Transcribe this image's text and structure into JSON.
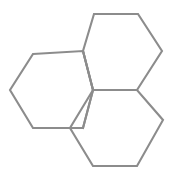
{
  "figure": {
    "kind": "chemical-structure-diagram",
    "title": "",
    "caption": "",
    "background_color": "#ffffff",
    "line_color": "#8c8c8c",
    "line_width": 2.1,
    "width": 183,
    "height": 180,
    "labels": [],
    "atom_labels": [],
    "charges": [],
    "stereo_marks": []
  },
  "chart_data": {
    "type": "diagram",
    "title": "",
    "subtitle": "",
    "xlabel": "",
    "ylabel": "",
    "grid": false,
    "legend": [],
    "annotations": [],
    "structure": {
      "name": "fused tricyclic hexagon skeleton",
      "ring_count": 3,
      "ring_size": 6,
      "fusion_type": "angular/peri-fused",
      "bond_style": "single-line skeletal",
      "vertex_count": 13,
      "bond_count": 15,
      "rings": [
        {
          "id": "ring-top-right",
          "label": "",
          "orientation": "flat-top",
          "vertices": [
            [
              94,
              14
            ],
            [
              138,
              14
            ],
            [
              162,
              51
            ],
            [
              137,
              90
            ],
            [
              93,
              90
            ],
            [
              83,
              51
            ]
          ]
        },
        {
          "id": "ring-left",
          "label": "",
          "orientation": "flat-top",
          "vertices": [
            [
              33,
              54
            ],
            [
              83,
              51
            ],
            [
              93,
              90
            ],
            [
              83,
              128
            ],
            [
              33,
              128
            ],
            [
              10,
              90
            ]
          ]
        },
        {
          "id": "ring-bottom-right",
          "label": "",
          "orientation": "flat-bottom",
          "vertices": [
            [
              93,
              90
            ],
            [
              137,
              90
            ],
            [
              163,
              120
            ],
            [
              137,
              166
            ],
            [
              93,
              166
            ],
            [
              70,
              128
            ]
          ]
        }
      ],
      "shared_bonds": [
        {
          "id": "bond-left-topright",
          "between": [
            "ring-left",
            "ring-top-right"
          ],
          "from": [
            83,
            51
          ],
          "to": [
            93,
            90
          ]
        },
        {
          "id": "bond-left-bottomright",
          "between": [
            "ring-left",
            "ring-bottom-right"
          ],
          "from": [
            93,
            90
          ],
          "to": [
            83,
            128
          ]
        },
        {
          "id": "bond-topright-bottomright",
          "between": [
            "ring-top-right",
            "ring-bottom-right"
          ],
          "from": [
            93,
            90
          ],
          "to": [
            137,
            90
          ]
        }
      ],
      "junction_vertices": [
        [
          93,
          90
        ],
        [
          83,
          51
        ],
        [
          137,
          90
        ],
        [
          83,
          128
        ]
      ]
    }
  }
}
